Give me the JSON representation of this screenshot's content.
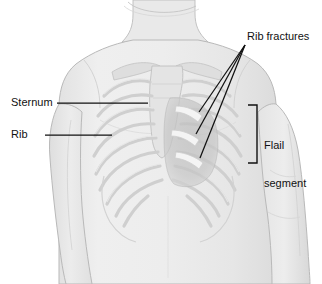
{
  "figure": {
    "kind": "medical-illustration",
    "background_color": "#ffffff"
  },
  "labels": {
    "sternum": "Sternum",
    "rib": "Rib",
    "rib_fractures": "Rib fractures",
    "flail_line1": "Flail",
    "flail_line2": "segment"
  },
  "colors": {
    "leader_line": "#111111",
    "text": "#111111",
    "skin_fill": "#eaeaea",
    "skin_edge": "#b9b9b9",
    "bone_fill": "#dcdcdc",
    "bone_edge": "#c3c3c3",
    "flail_shade": "#c2c2c2",
    "fracture_bone": "#f2f2f2"
  },
  "annotations": {
    "fracture_leader_count": 3,
    "bracket_orientation": "opens-left"
  }
}
